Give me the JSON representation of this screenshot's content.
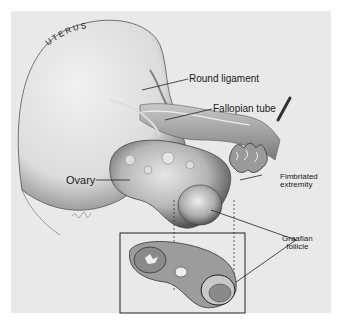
{
  "figure": {
    "number_mark": "",
    "signature": "Jirsh"
  },
  "labels": {
    "uterus": "UTERUS",
    "round_ligament": "Round ligament",
    "fallopian_tube": "Fallopian tube",
    "ovary": "Ovary",
    "fimbriated_line1": "Fimbriated",
    "fimbriated_line2": "extremity",
    "graafian_line1": "Graafian",
    "graafian_line2": "follicle"
  },
  "colors": {
    "background": "#e9e9e9",
    "ink": "#1a1a1a"
  }
}
